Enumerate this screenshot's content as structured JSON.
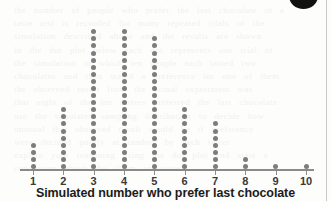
{
  "figure": {
    "x_axis_title": "Simulated number who prefer last chocolate",
    "corner_mark": "black-circle-marker",
    "dot_color": "#7d7d7d",
    "axis_color": "#8a8a8a",
    "title_color": "#1b1b1b"
  },
  "background_text": {
    "lines": [
      "the number of people who prefer the last chocolate in a",
      "taste test is recorded for many repeated trials of the",
      "simulation described above and the results are shown",
      "in the dot plot below each dot represents one trial of",
      "the simulation in which ten people each tasted two",
      "chocolates and then stated a preference for one of them",
      "the observed result from the actual experiment was",
      "that eight of the ten tasters preferred the last chocolate",
      "use the simulated sampling distribution to decide how",
      "unusual that observed result would be if preference",
      "were decided purely at random by each taster",
      "explain your reasoning using the dot plot and state a",
      "conclusion about the claim in context"
    ]
  },
  "chart_data": {
    "type": "bar",
    "plot_style": "dot-plot",
    "title": "",
    "xlabel": "Simulated number who prefer last chocolate",
    "ylabel": "",
    "grid": false,
    "legend": "none",
    "xlim": [
      1,
      10
    ],
    "categories": [
      "1",
      "2",
      "3",
      "4",
      "5",
      "6",
      "7",
      "8",
      "9",
      "10"
    ],
    "values": [
      4,
      9,
      20,
      20,
      19,
      9,
      7,
      2,
      1,
      1
    ],
    "total_dots": 92,
    "dot_unit": 1,
    "axis_ticks": [
      "1",
      "2",
      "3",
      "4",
      "5",
      "6",
      "7",
      "8",
      "9",
      "10"
    ]
  }
}
